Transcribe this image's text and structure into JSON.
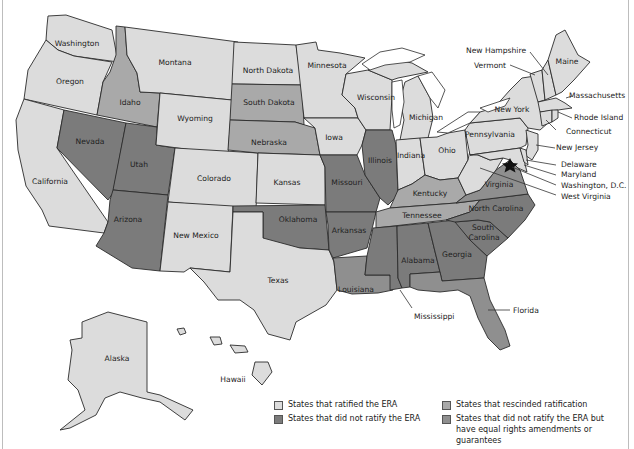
{
  "colors": {
    "ratified": "#dcdcdc",
    "rescinded": "#a9a9a9",
    "did_not_ratify": "#7b7b7b",
    "did_not_ratify_equal_rights": "#8f8f8f",
    "border": "#2b2b2b",
    "water": "#ffffff"
  },
  "legend": {
    "items": [
      {
        "key": "ratified",
        "label": "States that ratified the ERA"
      },
      {
        "key": "did_not_ratify",
        "label": "States that did not ratify the ERA"
      },
      {
        "key": "rescinded",
        "label": "States that rescinded ratification"
      },
      {
        "key": "did_not_ratify_equal_rights",
        "label_line1": "States that did not ratify the ERA but",
        "label_line2": "have equal rights amendments or guarantees"
      }
    ]
  },
  "capital_marker": {
    "icon": "star-icon",
    "label": "Washington, D.C."
  },
  "states": {
    "washington": {
      "label": "Washington",
      "status": "ratified"
    },
    "oregon": {
      "label": "Oregon",
      "status": "ratified"
    },
    "california": {
      "label": "California",
      "status": "ratified"
    },
    "idaho": {
      "label": "Idaho",
      "status": "rescinded"
    },
    "nevada": {
      "label": "Nevada",
      "status": "did_not_ratify"
    },
    "utah": {
      "label": "Utah",
      "status": "did_not_ratify"
    },
    "arizona": {
      "label": "Arizona",
      "status": "did_not_ratify"
    },
    "montana": {
      "label": "Montana",
      "status": "ratified"
    },
    "wyoming": {
      "label": "Wyoming",
      "status": "ratified"
    },
    "colorado": {
      "label": "Colorado",
      "status": "ratified"
    },
    "new_mexico": {
      "label": "New Mexico",
      "status": "ratified"
    },
    "north_dakota": {
      "label": "North Dakota",
      "status": "ratified"
    },
    "south_dakota": {
      "label": "South Dakota",
      "status": "rescinded"
    },
    "nebraska": {
      "label": "Nebraska",
      "status": "rescinded"
    },
    "kansas": {
      "label": "Kansas",
      "status": "ratified"
    },
    "oklahoma": {
      "label": "Oklahoma",
      "status": "did_not_ratify"
    },
    "texas": {
      "label": "Texas",
      "status": "ratified"
    },
    "minnesota": {
      "label": "Minnesota",
      "status": "ratified"
    },
    "iowa": {
      "label": "Iowa",
      "status": "ratified"
    },
    "missouri": {
      "label": "Missouri",
      "status": "did_not_ratify"
    },
    "arkansas": {
      "label": "Arkansas",
      "status": "did_not_ratify"
    },
    "louisiana": {
      "label": "Louisiana",
      "status": "did_not_ratify_equal_rights"
    },
    "wisconsin": {
      "label": "Wisconsin",
      "status": "ratified"
    },
    "illinois": {
      "label": "Illinois",
      "status": "did_not_ratify"
    },
    "michigan": {
      "label": "Michigan",
      "status": "ratified"
    },
    "indiana": {
      "label": "Indiana",
      "status": "ratified"
    },
    "ohio": {
      "label": "Ohio",
      "status": "ratified"
    },
    "kentucky": {
      "label": "Kentucky",
      "status": "rescinded"
    },
    "tennessee": {
      "label": "Tennessee",
      "status": "rescinded"
    },
    "mississippi": {
      "label": "Mississippi",
      "status": "did_not_ratify"
    },
    "alabama": {
      "label": "Alabama",
      "status": "did_not_ratify"
    },
    "georgia": {
      "label": "Georgia",
      "status": "did_not_ratify"
    },
    "florida": {
      "label": "Florida",
      "status": "did_not_ratify_equal_rights"
    },
    "south_carolina": {
      "label_line1": "South",
      "label_line2": "Carolina",
      "status": "did_not_ratify"
    },
    "north_carolina": {
      "label": "North Carolina",
      "status": "did_not_ratify"
    },
    "virginia": {
      "label": "Virginia",
      "status": "did_not_ratify_equal_rights"
    },
    "west_virginia": {
      "label": "West Virginia",
      "status": "ratified"
    },
    "pennsylvania": {
      "label": "Pennsylvania",
      "status": "ratified"
    },
    "new_york": {
      "label": "New York",
      "status": "ratified"
    },
    "new_jersey": {
      "label": "New Jersey",
      "status": "ratified"
    },
    "delaware": {
      "label": "Delaware",
      "status": "ratified"
    },
    "maryland": {
      "label": "Maryland",
      "status": "ratified"
    },
    "dc": {
      "label": "Washington, D.C.",
      "status": "ratified"
    },
    "connecticut": {
      "label": "Connecticut",
      "status": "ratified"
    },
    "rhode_island": {
      "label": "Rhode Island",
      "status": "ratified"
    },
    "massachusetts": {
      "label": "Massachusetts",
      "status": "ratified"
    },
    "vermont": {
      "label": "Vermont",
      "status": "ratified"
    },
    "new_hampshire": {
      "label": "New Hampshire",
      "status": "ratified"
    },
    "maine": {
      "label": "Maine",
      "status": "ratified"
    },
    "alaska": {
      "label": "Alaska",
      "status": "ratified"
    },
    "hawaii": {
      "label": "Hawaii",
      "status": "ratified"
    }
  }
}
